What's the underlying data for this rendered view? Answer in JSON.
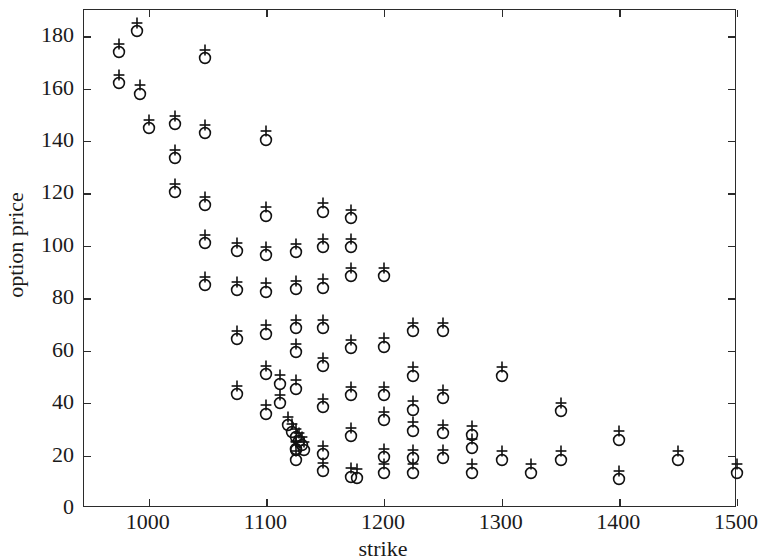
{
  "chart_data": {
    "type": "scatter",
    "title": "",
    "xlabel": "strike",
    "ylabel": "option price",
    "xlim": [
      945,
      1500
    ],
    "ylim": [
      0,
      190
    ],
    "xticks": [
      1000,
      1100,
      1200,
      1300,
      1400,
      1500
    ],
    "yticks": [
      0,
      20,
      40,
      60,
      80,
      100,
      120,
      140,
      160,
      180
    ],
    "grid": false,
    "legend": "none",
    "series": [
      {
        "name": "observed",
        "marker": "circle",
        "points": [
          [
            975,
            174.0
          ],
          [
            975,
            162.0
          ],
          [
            990,
            182.0
          ],
          [
            993,
            158.0
          ],
          [
            1000,
            145.0
          ],
          [
            1022,
            146.5
          ],
          [
            1022,
            133.5
          ],
          [
            1022,
            120.5
          ],
          [
            1048,
            171.5
          ],
          [
            1048,
            143.0
          ],
          [
            1048,
            115.5
          ],
          [
            1048,
            101.0
          ],
          [
            1048,
            85.0
          ],
          [
            1075,
            98.0
          ],
          [
            1075,
            83.0
          ],
          [
            1075,
            64.5
          ],
          [
            1075,
            43.5
          ],
          [
            1100,
            140.5
          ],
          [
            1100,
            111.5
          ],
          [
            1100,
            96.5
          ],
          [
            1100,
            82.5
          ],
          [
            1100,
            66.5
          ],
          [
            1100,
            51.0
          ],
          [
            1100,
            36.0
          ],
          [
            1112,
            47.5
          ],
          [
            1112,
            40.0
          ],
          [
            1118,
            31.5
          ],
          [
            1122,
            29.0
          ],
          [
            1125,
            27.0
          ],
          [
            1128,
            25.5
          ],
          [
            1130,
            24.0
          ],
          [
            1125,
            22.5
          ],
          [
            1132,
            22.0
          ],
          [
            1125,
            97.5
          ],
          [
            1125,
            83.5
          ],
          [
            1125,
            68.5
          ],
          [
            1125,
            59.5
          ],
          [
            1125,
            45.5
          ],
          [
            1125,
            22.0
          ],
          [
            1125,
            18.5
          ],
          [
            1148,
            113.0
          ],
          [
            1148,
            99.5
          ],
          [
            1148,
            84.0
          ],
          [
            1148,
            68.5
          ],
          [
            1148,
            54.0
          ],
          [
            1148,
            38.5
          ],
          [
            1148,
            20.5
          ],
          [
            1148,
            14.0
          ],
          [
            1172,
            110.5
          ],
          [
            1172,
            99.5
          ],
          [
            1172,
            88.5
          ],
          [
            1172,
            61.0
          ],
          [
            1172,
            43.0
          ],
          [
            1172,
            27.5
          ],
          [
            1172,
            12.0
          ],
          [
            1177,
            11.5
          ],
          [
            1200,
            88.5
          ],
          [
            1200,
            61.5
          ],
          [
            1200,
            43.0
          ],
          [
            1200,
            33.5
          ],
          [
            1200,
            19.5
          ],
          [
            1200,
            13.5
          ],
          [
            1225,
            67.5
          ],
          [
            1225,
            50.5
          ],
          [
            1225,
            37.5
          ],
          [
            1225,
            29.5
          ],
          [
            1225,
            19.0
          ],
          [
            1225,
            13.5
          ],
          [
            1250,
            67.5
          ],
          [
            1250,
            42.0
          ],
          [
            1250,
            28.5
          ],
          [
            1250,
            19.0
          ],
          [
            1275,
            28.0
          ],
          [
            1275,
            23.0
          ],
          [
            1275,
            13.5
          ],
          [
            1300,
            50.5
          ],
          [
            1300,
            18.5
          ],
          [
            1325,
            13.5
          ],
          [
            1350,
            37.0
          ],
          [
            1350,
            18.5
          ],
          [
            1400,
            26.0
          ],
          [
            1400,
            11.0
          ],
          [
            1450,
            18.5
          ],
          [
            1500,
            13.5
          ]
        ]
      },
      {
        "name": "model",
        "marker": "plus",
        "note": "nearly coincident with the observed series; plotted a few units above each circle",
        "offset_y": 3.2
      }
    ]
  },
  "axes": {
    "x_tick_labels": [
      "1000",
      "1100",
      "1200",
      "1300",
      "1400",
      "1500"
    ],
    "y_tick_labels": [
      "0",
      "20",
      "40",
      "60",
      "80",
      "100",
      "120",
      "140",
      "160",
      "180"
    ],
    "x_title": "strike",
    "y_title": "option price"
  },
  "style": {
    "frame_color": "#2b2b2b",
    "marker_color": "#111111",
    "background": "#ffffff"
  }
}
